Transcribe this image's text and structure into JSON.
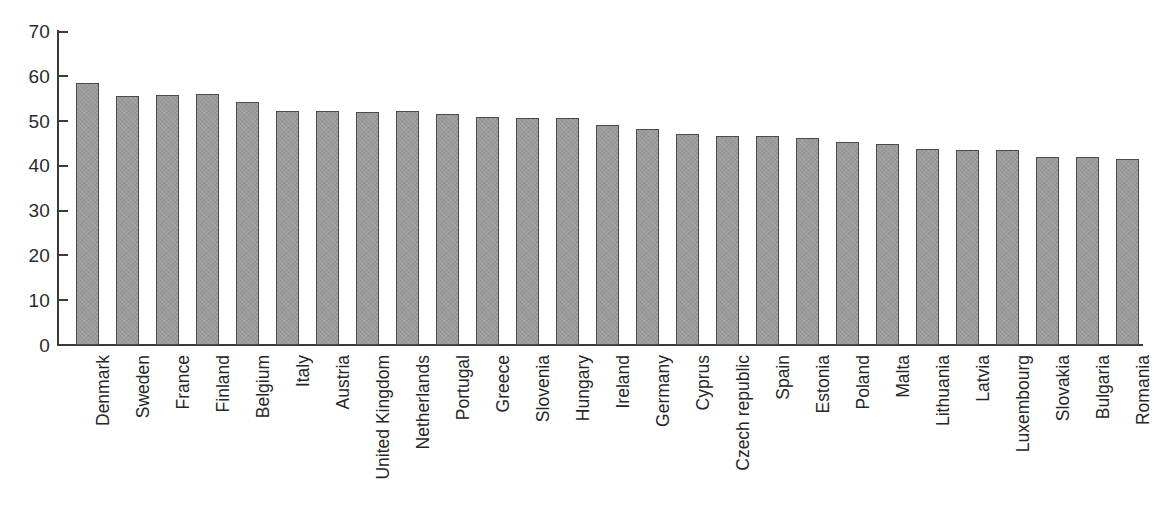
{
  "chart_data": {
    "type": "bar",
    "title": "",
    "subtitle": "",
    "xlabel": "",
    "ylabel": "",
    "ylim": [
      0,
      70
    ],
    "y_ticks": [
      0,
      10,
      20,
      30,
      40,
      50,
      60,
      70
    ],
    "grid": false,
    "legend": false,
    "bar_color": "#9b9b9b",
    "bar_border_color": "#4a4a4a",
    "axis_color": "#3a3a3a",
    "categories": [
      "Denmark",
      "Sweden",
      "France",
      "Finland",
      "Belgium",
      "Italy",
      "Austria",
      "United Kingdom",
      "Netherlands",
      "Portugal",
      "Greece",
      "Slovenia",
      "Hungary",
      "Ireland",
      "Germany",
      "Cyprus",
      "Czech republic",
      "Spain",
      "Estonia",
      "Poland",
      "Malta",
      "Lithuania",
      "Latvia",
      "Luxembourg",
      "Slovakia",
      "Bulgaria",
      "Romania"
    ],
    "values": [
      58.5,
      55.7,
      55.9,
      56.0,
      54.3,
      52.3,
      52.3,
      52.0,
      52.3,
      51.5,
      51.0,
      50.7,
      50.7,
      49.2,
      48.2,
      47.1,
      46.7,
      46.7,
      46.3,
      45.3,
      44.8,
      43.8,
      43.6,
      43.6,
      41.9,
      41.9,
      41.5
    ]
  }
}
